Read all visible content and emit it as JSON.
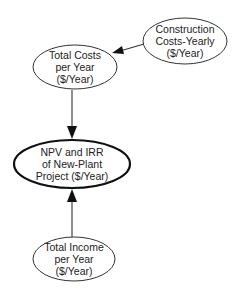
{
  "diagram": {
    "type": "influence-diagram",
    "nodes": [
      {
        "id": "construction",
        "lines": [
          "Construction",
          "Costs-Yearly",
          "($/Year)"
        ],
        "cx": 185,
        "cy": 41,
        "rx": 42,
        "ry": 23,
        "primary": false
      },
      {
        "id": "total_costs",
        "lines": [
          "Total Costs",
          "per Year",
          "($/Year)"
        ],
        "cx": 75,
        "cy": 67,
        "rx": 42,
        "ry": 22,
        "primary": false
      },
      {
        "id": "npv_irr",
        "lines": [
          "NPV and IRR",
          "of New-Plant",
          "Project ($/Year)"
        ],
        "cx": 72,
        "cy": 164,
        "rx": 58,
        "ry": 24,
        "primary": true
      },
      {
        "id": "total_income",
        "lines": [
          "Total Income",
          "per Year",
          "($/Year)"
        ],
        "cx": 74,
        "cy": 259,
        "rx": 41,
        "ry": 22,
        "primary": false
      }
    ],
    "edges": [
      {
        "from": "construction",
        "to": "total_costs"
      },
      {
        "from": "total_costs",
        "to": "npv_irr"
      },
      {
        "from": "total_income",
        "to": "npv_irr"
      }
    ]
  }
}
